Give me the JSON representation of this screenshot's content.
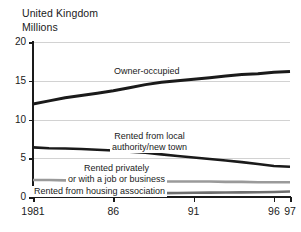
{
  "header": {
    "region": "United Kingdom",
    "units": "Millions"
  },
  "chart_data": {
    "type": "line",
    "title": "United Kingdom",
    "subtitle": "Millions",
    "xlabel": "",
    "ylabel": "Millions",
    "xlim": [
      1981,
      1997
    ],
    "ylim": [
      0,
      20
    ],
    "yticks": [
      0,
      5,
      10,
      15,
      20
    ],
    "ytick_labels": [
      "0",
      "5",
      "10",
      "15",
      "20"
    ],
    "xticks": [
      1981,
      1986,
      1991,
      1996,
      1997
    ],
    "xtick_labels": [
      "1981",
      "86",
      "91",
      "96",
      "97"
    ],
    "grid": "horizontal",
    "legend": "inline-annotations",
    "series": [
      {
        "name": "Owner-occupied",
        "color": "#1a1a1a",
        "width": 3,
        "x": [
          1981,
          1982,
          1983,
          1984,
          1985,
          1986,
          1987,
          1988,
          1989,
          1990,
          1991,
          1992,
          1993,
          1994,
          1995,
          1996,
          1997
        ],
        "values": [
          12.0,
          12.4,
          12.8,
          13.1,
          13.4,
          13.7,
          14.1,
          14.5,
          14.8,
          15.0,
          15.2,
          15.4,
          15.6,
          15.8,
          15.9,
          16.1,
          16.2
        ]
      },
      {
        "name": "Rented from local authority/new town",
        "color": "#1a1a1a",
        "width": 2.6,
        "x": [
          1981,
          1982,
          1983,
          1984,
          1985,
          1986,
          1987,
          1988,
          1989,
          1990,
          1991,
          1992,
          1993,
          1994,
          1995,
          1996,
          1997
        ],
        "values": [
          6.4,
          6.3,
          6.25,
          6.2,
          6.1,
          6.0,
          5.85,
          5.7,
          5.5,
          5.3,
          5.1,
          4.9,
          4.7,
          4.5,
          4.25,
          4.0,
          3.9
        ]
      },
      {
        "name": "Rented privately or with a job or business",
        "color": "#9a9a9a",
        "width": 2.6,
        "x": [
          1981,
          1982,
          1983,
          1984,
          1985,
          1986,
          1987,
          1988,
          1989,
          1990,
          1991,
          1992,
          1993,
          1994,
          1995,
          1996,
          1997
        ],
        "values": [
          2.2,
          2.2,
          2.15,
          2.1,
          2.1,
          2.05,
          2.05,
          2.0,
          2.0,
          2.0,
          2.0,
          2.0,
          1.95,
          1.95,
          1.9,
          1.9,
          1.9
        ]
      },
      {
        "name": "Rented from housing association",
        "color": "#6e6e6e",
        "width": 2.6,
        "x": [
          1981,
          1982,
          1983,
          1984,
          1985,
          1986,
          1987,
          1988,
          1989,
          1990,
          1991,
          1992,
          1993,
          1994,
          1995,
          1996,
          1997
        ],
        "values": [
          0.4,
          0.4,
          0.42,
          0.44,
          0.45,
          0.46,
          0.48,
          0.5,
          0.5,
          0.52,
          0.54,
          0.56,
          0.58,
          0.6,
          0.62,
          0.65,
          0.7
        ]
      }
    ],
    "annotations": [
      {
        "name": "owner-occupied",
        "lines": [
          "Owner-occupied"
        ]
      },
      {
        "name": "rented-local-authority",
        "lines": [
          "Rented from local",
          "authority/new town"
        ]
      },
      {
        "name": "rented-privately",
        "lines": [
          "Rented privately",
          "or with a job or business"
        ]
      },
      {
        "name": "rented-housing-association",
        "lines": [
          "Rented from housing association"
        ]
      }
    ]
  }
}
